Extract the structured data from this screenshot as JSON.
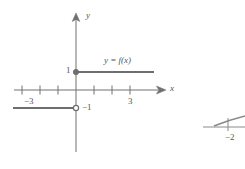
{
  "figure": {
    "stroke_color": "#6e6e6e",
    "axis_color": "#707070",
    "label_color": "#555555",
    "background": "#ffffff",
    "axes": {
      "x_label": "x",
      "y_label": "y",
      "origin_px": {
        "x": 76,
        "y": 90
      },
      "unit_px": 18,
      "x_range": [
        -3.8,
        4.6
      ],
      "y_range": [
        -2.6,
        3.8
      ],
      "x_ticks": [
        -3,
        -2,
        -1,
        1,
        2,
        3
      ],
      "y_ticks": [],
      "arrows": [
        "x-positive",
        "y-positive"
      ]
    },
    "tick_labels": [
      {
        "text": "−3",
        "value": -3,
        "axis": "x",
        "x": 24,
        "y": 97
      },
      {
        "text": "3",
        "value": 3,
        "axis": "x",
        "x": 128,
        "y": 97
      },
      {
        "text": "1",
        "value": 1,
        "axis": "y",
        "x": 66,
        "y": 61
      },
      {
        "text": "−1",
        "value": -1,
        "axis": "y",
        "x": 82,
        "y": 105
      }
    ],
    "function_label": {
      "text": "y = f(x)",
      "x": 104,
      "y": 57
    },
    "segments": [
      {
        "name": "upper-ray",
        "y_value": 1,
        "x_start": 0,
        "x_end": 4.3,
        "start_endpoint": "closed",
        "end_endpoint": "open-ended",
        "px": {
          "x1": 76,
          "y1": 72,
          "x2": 154,
          "y2": 72
        }
      },
      {
        "name": "lower-ray",
        "y_value": -1,
        "x_start": -3.5,
        "x_end": 0,
        "start_endpoint": "open-ended",
        "end_endpoint": "open",
        "px": {
          "x1": 13,
          "y1": 108,
          "x2": 76,
          "y2": 108
        }
      }
    ],
    "points": [
      {
        "name": "closed-dot",
        "type": "closed",
        "coord": [
          0,
          1
        ],
        "px": {
          "x": 76,
          "y": 72
        }
      },
      {
        "name": "open-dot",
        "type": "open",
        "coord": [
          0,
          -1
        ],
        "px": {
          "x": 76,
          "y": 108
        }
      }
    ],
    "fragment": {
      "name": "partial-adjacent-figure",
      "label": "−2",
      "label_x": 225,
      "label_y": 133
    }
  }
}
